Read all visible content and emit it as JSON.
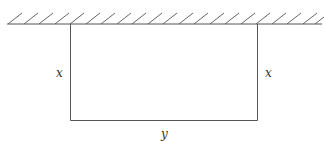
{
  "diagram": {
    "labels": {
      "left_side": "x",
      "right_side": "x",
      "bottom_side": "y"
    },
    "colors": {
      "stroke": "#555555",
      "text": "#333333",
      "background": "#ffffff"
    }
  }
}
